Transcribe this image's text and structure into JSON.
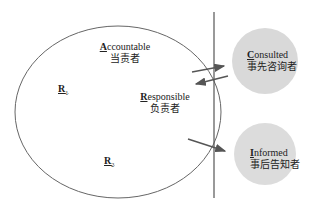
{
  "diagram": {
    "type": "RACI role diagram",
    "main_circle": {
      "roles": {
        "accountable": {
          "initial": "A",
          "rest": "ccountable",
          "chinese": "当责者"
        },
        "responsible": {
          "initial": "R",
          "rest": "esponsible",
          "chinese": "负责者"
        },
        "r1": {
          "letter": "R",
          "sub": "1"
        },
        "r2": {
          "letter": "R",
          "sub": "2"
        }
      }
    },
    "external": {
      "consulted": {
        "initial": "C",
        "rest": "onsulted",
        "chinese": "事先咨询者",
        "fill": "#d9d9d9"
      },
      "informed": {
        "initial": "I",
        "rest": "nformed",
        "chinese": "事后告知者",
        "fill": "#d9d9d9"
      }
    },
    "edges": [
      {
        "from": "responsible",
        "to": "consulted",
        "direction": "to"
      },
      {
        "from": "consulted",
        "to": "responsible",
        "direction": "to"
      },
      {
        "from": "responsible",
        "to": "informed",
        "direction": "to"
      }
    ],
    "colors": {
      "line": "#555555",
      "arrow": "#555555",
      "divider": "#555555"
    }
  }
}
